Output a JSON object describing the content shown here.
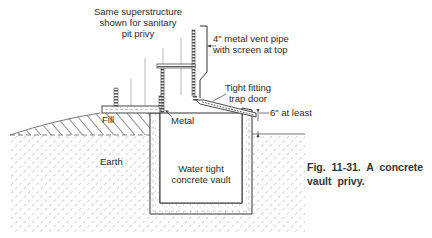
{
  "figure": {
    "caption_number": "Fig. 11-31.",
    "caption_text": "A concrete vault privy.",
    "caption_full": "Fig. 11-31. A concrete vault privy."
  },
  "labels": {
    "superstructure_line1": "Same superstructure",
    "superstructure_line2": "shown for sanitary",
    "superstructure_line3": "pit privy",
    "vent_line1": "4\" metal vent pipe",
    "vent_line2": "with screen at top",
    "trapdoor_line1": "Tight fitting",
    "trapdoor_line2": "trap door",
    "clearance": "6\" at least",
    "fill": "Fill",
    "metal": "Metal",
    "earth": "Earth",
    "vault_line1": "Water tight",
    "vault_line2": "concrete vault"
  },
  "colors": {
    "ink": "#333333",
    "hatch": "#7a7a7a",
    "background": "#ffffff"
  }
}
